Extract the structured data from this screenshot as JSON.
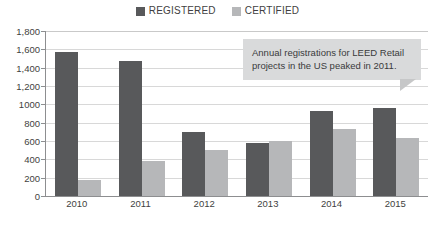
{
  "chart_data": {
    "type": "bar",
    "title": "",
    "subtitle": "",
    "xlabel": "",
    "ylabel": "",
    "categories": [
      "2010",
      "2011",
      "2012",
      "2013",
      "2014",
      "2015"
    ],
    "series": [
      {
        "name": "REGISTERED",
        "color": "#58595b",
        "values": [
          1570,
          1470,
          700,
          580,
          930,
          960
        ]
      },
      {
        "name": "CERTIFIED",
        "color": "#b6b7b9",
        "values": [
          180,
          380,
          500,
          595,
          730,
          630
        ]
      }
    ],
    "ylim": [
      0,
      1800
    ],
    "ytick_values": [
      1800,
      1600,
      1400,
      1200,
      1000,
      800,
      600,
      400,
      200,
      0
    ],
    "ytick_labels": [
      "1,800",
      "1,600",
      "1,400",
      "1,200",
      "1000",
      "800",
      "600",
      "400",
      "200",
      "0"
    ],
    "grid": true,
    "legend_position": "top-center",
    "annotations": [
      {
        "text": "Annual registrations for LEED Retail projects in the US peaked in 2011.",
        "style": "callout-box",
        "background": "#d9dadb"
      }
    ]
  },
  "legend": {
    "items": [
      {
        "label": "REGISTERED",
        "color": "#58595b"
      },
      {
        "label": "CERTIFIED",
        "color": "#b6b7b9"
      }
    ]
  },
  "callout": {
    "text": "Annual registrations for LEED Retail projects in the US peaked in 2011."
  },
  "colors": {
    "registered": "#58595b",
    "certified": "#b6b7b9",
    "callout_bg": "#d9dadb",
    "gridline": "#d8d8d8",
    "axis": "#8d8e90",
    "text": "#3f3f41"
  }
}
